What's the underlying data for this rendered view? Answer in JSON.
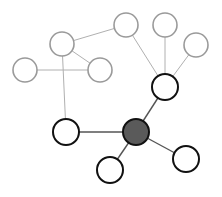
{
  "diagram": {
    "type": "network-graph",
    "colors": {
      "faded_stroke": "#9a9a9a",
      "faded_edge": "#b0b0b0",
      "active_stroke": "#111111",
      "active_edge": "#555555",
      "hub_fill": "#5a5a5a",
      "node_fill": "#ffffff"
    },
    "nodes": [
      {
        "id": "A",
        "x": 25,
        "y": 70,
        "r": 12,
        "style": "faded"
      },
      {
        "id": "B",
        "x": 62,
        "y": 44,
        "r": 12,
        "style": "faded"
      },
      {
        "id": "C",
        "x": 100,
        "y": 70,
        "r": 12,
        "style": "faded"
      },
      {
        "id": "D",
        "x": 126,
        "y": 25,
        "r": 12,
        "style": "faded"
      },
      {
        "id": "E",
        "x": 165,
        "y": 25,
        "r": 12,
        "style": "faded"
      },
      {
        "id": "F",
        "x": 196,
        "y": 45,
        "r": 12,
        "style": "faded"
      },
      {
        "id": "G",
        "x": 165,
        "y": 87,
        "r": 13,
        "style": "active"
      },
      {
        "id": "H",
        "x": 136,
        "y": 132,
        "r": 13,
        "style": "hub"
      },
      {
        "id": "I",
        "x": 66,
        "y": 132,
        "r": 13,
        "style": "active"
      },
      {
        "id": "J",
        "x": 110,
        "y": 170,
        "r": 13,
        "style": "active"
      },
      {
        "id": "K",
        "x": 186,
        "y": 159,
        "r": 13,
        "style": "active"
      }
    ],
    "edges": [
      {
        "from": "A",
        "to": "C",
        "style": "faded"
      },
      {
        "from": "B",
        "to": "C",
        "style": "faded"
      },
      {
        "from": "B",
        "to": "D",
        "style": "faded"
      },
      {
        "from": "B",
        "to": "I",
        "style": "faded"
      },
      {
        "from": "D",
        "to": "G",
        "style": "faded"
      },
      {
        "from": "E",
        "to": "G",
        "style": "faded"
      },
      {
        "from": "F",
        "to": "G",
        "style": "faded"
      },
      {
        "from": "G",
        "to": "H",
        "style": "active"
      },
      {
        "from": "I",
        "to": "H",
        "style": "active"
      },
      {
        "from": "J",
        "to": "H",
        "style": "active"
      },
      {
        "from": "K",
        "to": "H",
        "style": "active"
      }
    ]
  }
}
